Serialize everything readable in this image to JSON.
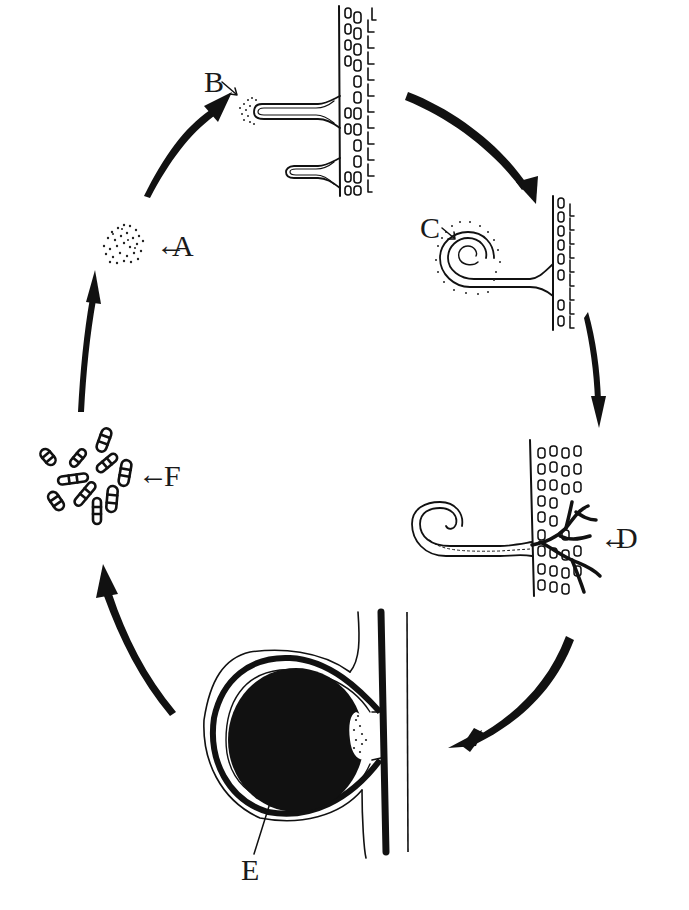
{
  "diagram": {
    "type": "life-cycle",
    "stages": [
      {
        "id": "A",
        "label": "A",
        "depiction": "cluster of dots (spore mass)"
      },
      {
        "id": "B",
        "label": "B",
        "depiction": "dot cluster at tip of hair-like outgrowth on cellular tissue"
      },
      {
        "id": "C",
        "label": "C",
        "depiction": "coiled tip of outgrowth surrounded by dots"
      },
      {
        "id": "D",
        "label": "D",
        "depiction": "curled outgrowth with dark branching filaments penetrating cellular tissue"
      },
      {
        "id": "E",
        "label": "E",
        "depiction": "large dark spherical body with layered wall attached to stem"
      },
      {
        "id": "F",
        "label": "F",
        "depiction": "scattered banded spindle-shaped spores"
      }
    ],
    "cycle_order": [
      "A",
      "B",
      "C",
      "D",
      "E",
      "F"
    ],
    "label_arrow_glyph": "←",
    "pointer_glyph": "→",
    "colors": {
      "ink": "#111111",
      "background": "#ffffff"
    }
  }
}
